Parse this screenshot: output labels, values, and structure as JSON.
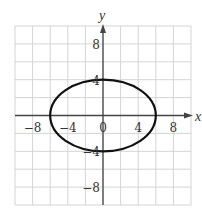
{
  "chart_data": {
    "type": "line",
    "title": "",
    "xlabel": "x",
    "ylabel": "y",
    "xlim": [
      -10,
      10
    ],
    "ylim": [
      -10,
      10
    ],
    "grid": true,
    "grid_step": 2,
    "x_ticks": [
      {
        "value": -8,
        "label": "−8"
      },
      {
        "value": -4,
        "label": "−4"
      },
      {
        "value": 0,
        "label": "0"
      },
      {
        "value": 4,
        "label": "4"
      },
      {
        "value": 8,
        "label": "8"
      }
    ],
    "y_ticks": [
      {
        "value": 8,
        "label": "8"
      },
      {
        "value": 4,
        "label": "4"
      },
      {
        "value": -4,
        "label": "−4"
      },
      {
        "value": -8,
        "label": "−8"
      }
    ],
    "series": [
      {
        "name": "ellipse",
        "shape": "ellipse",
        "equation": "x^2/36 + y^2/16 = 1",
        "center": [
          0,
          0
        ],
        "rx": 6,
        "ry": 4,
        "points": [
          [
            6,
            0
          ],
          [
            0,
            4
          ],
          [
            -6,
            0
          ],
          [
            0,
            -4
          ]
        ],
        "color": "#111111"
      }
    ]
  },
  "colors": {
    "grid": "#d4d4d4",
    "axis": "#444444",
    "curve": "#111111"
  }
}
